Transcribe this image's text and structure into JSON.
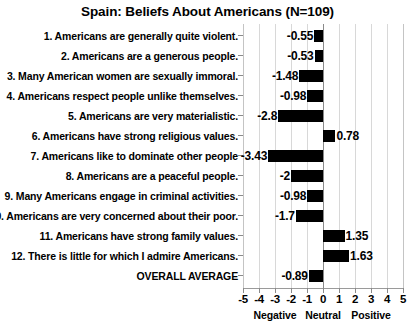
{
  "chart_data": {
    "type": "bar",
    "orientation": "horizontal",
    "title": "Spain: Beliefs About Americans (N=109)",
    "xlabel": "",
    "ylabel": "",
    "xlim": [
      -5,
      5
    ],
    "xticks": [
      -5,
      -4,
      -3,
      -2,
      -1,
      0,
      1,
      2,
      3,
      4,
      5
    ],
    "xtick_labels": [
      "-5",
      "-4",
      "-3",
      "-2",
      "-1",
      "0",
      "1",
      "2",
      "3",
      "4",
      "5"
    ],
    "zone_labels": [
      {
        "text": "Negative",
        "at": -3
      },
      {
        "text": "Neutral",
        "at": 0
      },
      {
        "text": "Positive",
        "at": 3
      }
    ],
    "grid": true,
    "legend": "none",
    "bar_color": "#000000",
    "categories": [
      "1. Americans are generally quite violent.",
      "2. Americans are a generous people.",
      "3. Many American women are sexually immoral.",
      "4. Americans respect people unlike themselves.",
      "5. Americans are very materialistic.",
      "6. Americans have strong religious values.",
      "7. Americans like to dominate other people",
      "8. Americans are a peaceful people.",
      "9. Many Americans engage in criminal activities.",
      "10. Americans are very concerned about their poor.",
      "11. Americans have strong family values.",
      "12. There is little for which I admire Americans.",
      "OVERALL AVERAGE"
    ],
    "values": [
      -0.55,
      -0.53,
      -1.48,
      -0.98,
      -2.8,
      0.78,
      -3.43,
      -2,
      -0.98,
      -1.7,
      1.35,
      1.63,
      -0.89
    ],
    "value_labels": [
      "-0.55",
      "-0.53",
      "-1.48",
      "-0.98",
      "-2.8",
      "0.78",
      "-3.43",
      "-2",
      "-0.98",
      "-1.7",
      "1.35",
      "1.63",
      "-0.89"
    ]
  }
}
